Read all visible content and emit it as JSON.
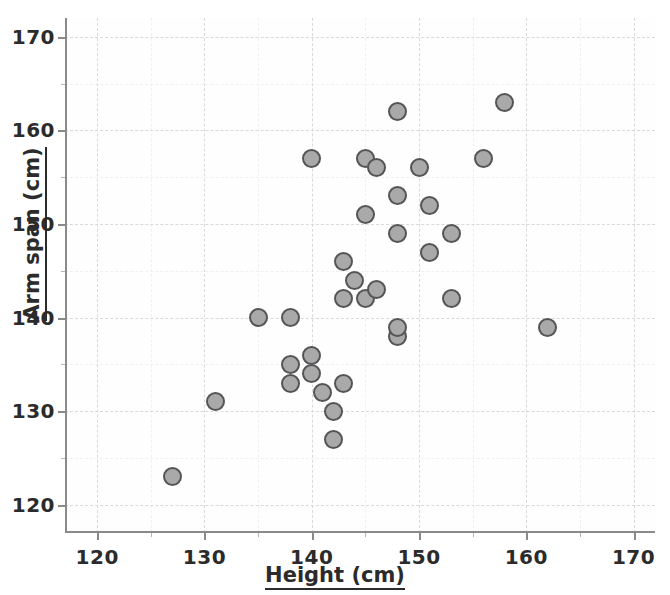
{
  "chart_data": {
    "type": "scatter",
    "title": "",
    "xlabel": "Height (cm)",
    "ylabel": "Arm span (cm)",
    "xlim": [
      117,
      172
    ],
    "ylim": [
      117,
      172
    ],
    "xticks": [
      120,
      130,
      140,
      150,
      160,
      170
    ],
    "yticks": [
      120,
      130,
      140,
      150,
      160,
      170
    ],
    "xtick_labels": [
      "120",
      "130",
      "140",
      "150",
      "160",
      "170"
    ],
    "ytick_labels": [
      "120",
      "130",
      "140",
      "150",
      "160",
      "170"
    ],
    "x_minor_step": 5,
    "y_minor_step": 5,
    "grid": true,
    "legend": "none",
    "marker": {
      "shape": "circle",
      "fill_color": "#a9a9a9",
      "edge_color": "#555558",
      "size_px": 19
    },
    "points": [
      {
        "x": 127,
        "y": 123
      },
      {
        "x": 131,
        "y": 131
      },
      {
        "x": 135,
        "y": 140
      },
      {
        "x": 138,
        "y": 140
      },
      {
        "x": 138,
        "y": 135
      },
      {
        "x": 138,
        "y": 133
      },
      {
        "x": 140,
        "y": 136
      },
      {
        "x": 140,
        "y": 134
      },
      {
        "x": 140,
        "y": 157
      },
      {
        "x": 141,
        "y": 132
      },
      {
        "x": 142,
        "y": 130
      },
      {
        "x": 142,
        "y": 127
      },
      {
        "x": 143,
        "y": 133
      },
      {
        "x": 143,
        "y": 146
      },
      {
        "x": 143,
        "y": 142
      },
      {
        "x": 144,
        "y": 144
      },
      {
        "x": 145,
        "y": 142
      },
      {
        "x": 145,
        "y": 151
      },
      {
        "x": 145,
        "y": 157
      },
      {
        "x": 146,
        "y": 143
      },
      {
        "x": 146,
        "y": 156
      },
      {
        "x": 148,
        "y": 138
      },
      {
        "x": 148,
        "y": 139
      },
      {
        "x": 148,
        "y": 149
      },
      {
        "x": 148,
        "y": 153
      },
      {
        "x": 148,
        "y": 162
      },
      {
        "x": 150,
        "y": 156
      },
      {
        "x": 151,
        "y": 147
      },
      {
        "x": 151,
        "y": 152
      },
      {
        "x": 153,
        "y": 142
      },
      {
        "x": 153,
        "y": 149
      },
      {
        "x": 156,
        "y": 157
      },
      {
        "x": 158,
        "y": 163
      },
      {
        "x": 162,
        "y": 139
      }
    ]
  },
  "axes": {
    "x_title": "Height (cm)",
    "y_title": "Arm span (cm)"
  }
}
